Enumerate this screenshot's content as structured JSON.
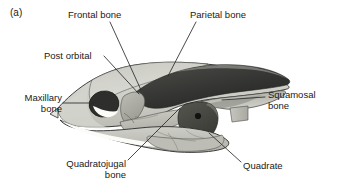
{
  "figure": {
    "panel_letter": "(a)",
    "caption_type": "anatomical-line-drawing"
  },
  "labels": {
    "frontal": "Frontal bone",
    "parietal": "Parietal bone",
    "post_orbital": "Post orbital",
    "maxillary_line1": "Maxillary",
    "maxillary_line2": "bone",
    "squamosal_line1": "Squamosal",
    "squamosal_line2": "bone",
    "quadratojugal_line1": "Quadratojugal",
    "quadratojugal_line2": "bone",
    "quadrate": "Quadrate"
  },
  "colors": {
    "background": "#ffffff",
    "text": "#1a1a1a",
    "outline": "#2b2b2b",
    "leader_line": "#2b2b2b",
    "bone_light": "#d2d2cc",
    "bone_lighter": "#e2e2dd",
    "bone_mid": "#b5b5ae",
    "bone_mid_dark": "#9a9a93",
    "bone_dark": "#6f6f69",
    "cavity_dark": "#3a3a38",
    "cavity_darker": "#2e2e2c",
    "orbit_highlight": "#fbfbf8",
    "foramen": "#141414"
  },
  "structures": [
    {
      "name": "frontal-bone",
      "shade": "bone_light"
    },
    {
      "name": "parietal-bone",
      "shade": "cavity_dark"
    },
    {
      "name": "post-orbital",
      "shade": "bone_mid"
    },
    {
      "name": "orbit",
      "shade": "cavity_dark"
    },
    {
      "name": "maxillary-bone",
      "shade": "bone_lighter"
    },
    {
      "name": "squamosal-bone",
      "shade": "bone_mid_dark"
    },
    {
      "name": "quadrate",
      "shade": "cavity_darker"
    },
    {
      "name": "quadratojugal-bone",
      "shade": "bone_light"
    },
    {
      "name": "lower-jaw",
      "shade": "bone_light"
    }
  ]
}
